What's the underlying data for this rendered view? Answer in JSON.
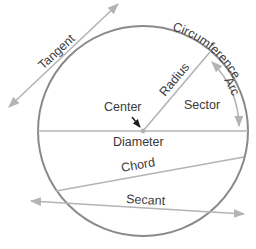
{
  "diagram": {
    "type": "circle-parts",
    "colors": {
      "circle": "#8a8a8a",
      "lines": "#b4b4b4",
      "text": "#3a3a3a",
      "center_arrow": "#1a1a1a"
    },
    "labels": {
      "tangent": "Tangent",
      "circumference": "Circumference",
      "radius": "Radius",
      "arc": "Arc",
      "sector": "Sector",
      "center": "Center",
      "diameter": "Diameter",
      "chord": "Chord",
      "secant": "Secant"
    }
  }
}
